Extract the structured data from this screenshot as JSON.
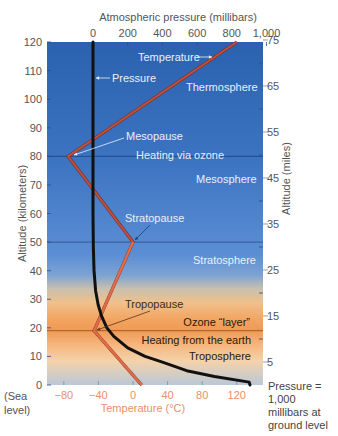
{
  "chart_data": {
    "type": "line",
    "title": "",
    "top_axis": {
      "label": "Atmospheric pressure (millibars)",
      "ticks": [
        0,
        200,
        400,
        600,
        800,
        1000
      ],
      "tick_labels": [
        "0",
        "200",
        "400",
        "600",
        "800",
        "1,000"
      ],
      "range": [
        0,
        1000
      ]
    },
    "bottom_axis": {
      "label": "Temperature (°C)",
      "ticks": [
        -80,
        -40,
        0,
        40,
        80,
        120
      ],
      "tick_labels": [
        "−80",
        "−40",
        "0",
        "40",
        "80",
        "120"
      ],
      "range": [
        -120,
        132
      ]
    },
    "left_axis": {
      "label": "Altitude (kilometers)",
      "ticks": [
        0,
        10,
        20,
        30,
        40,
        50,
        60,
        70,
        80,
        90,
        100,
        110,
        120
      ],
      "range": [
        0,
        120
      ],
      "sea_level_label": [
        "(Sea",
        "level)"
      ]
    },
    "right_axis": {
      "label": "Altitude (miles)",
      "ticks": [
        5,
        15,
        25,
        35,
        45,
        55,
        65,
        75
      ],
      "minor_ticks": [
        10,
        20,
        30,
        40,
        50,
        60,
        70
      ]
    },
    "series": [
      {
        "name": "Temperature",
        "units": "°C",
        "points": [
          [
            10,
            0
          ],
          [
            -45,
            19
          ],
          [
            0,
            50
          ],
          [
            -75,
            80
          ],
          [
            120,
            120
          ]
        ]
      },
      {
        "name": "Pressure",
        "units": "millibars",
        "points": [
          [
            1000,
            0
          ],
          [
            900,
            1
          ],
          [
            700,
            3
          ],
          [
            540,
            5
          ],
          [
            400,
            8
          ],
          [
            300,
            10
          ],
          [
            200,
            13
          ],
          [
            120,
            17
          ],
          [
            80,
            20
          ],
          [
            50,
            24
          ],
          [
            30,
            28
          ],
          [
            15,
            33
          ],
          [
            6,
            40
          ],
          [
            2,
            48
          ],
          [
            0,
            60
          ],
          [
            0,
            120
          ]
        ]
      }
    ],
    "reference_lines": [
      {
        "label": "Mesopause",
        "altitude_km": 80
      },
      {
        "label": "Stratopause",
        "altitude_km": 50
      },
      {
        "label": "Tropopause",
        "altitude_km": 19
      }
    ],
    "layers": [
      {
        "name": "Thermosphere",
        "range_km": [
          80,
          120
        ]
      },
      {
        "name": "Mesosphere",
        "range_km": [
          50,
          80
        ]
      },
      {
        "name": "Stratosphere",
        "range_km": [
          19,
          50
        ]
      },
      {
        "name": "Troposphere",
        "range_km": [
          0,
          19
        ]
      }
    ],
    "annotations": {
      "temperature": "Temperature",
      "pressure": "Pressure",
      "thermosphere": "Thermosphere",
      "mesopause": "Mesopause",
      "heating_ozone": "Heating via ozone",
      "mesosphere": "Mesosphere",
      "stratopause": "Stratopause",
      "stratosphere": "Stratosphere",
      "tropopause": "Tropopause",
      "ozone_layer": "Ozone “layer”",
      "heating_earth": "Heating from the earth",
      "troposphere": "Troposphere",
      "pressure_note": [
        "Pressure =",
        "1,000",
        "millibars at",
        "ground level"
      ]
    },
    "colors": {
      "temperature_line": "#c0503e",
      "temperature_line_low": "#e8704a",
      "pressure_line": "#111111",
      "temperature_axis_text": "#e8906a",
      "axis_text": "#555555",
      "sky_top": "#2a62b0",
      "sky_mid": "#5b8ed4",
      "ozone_orange": "#f2a460",
      "ground": "#b9c8d8"
    }
  }
}
